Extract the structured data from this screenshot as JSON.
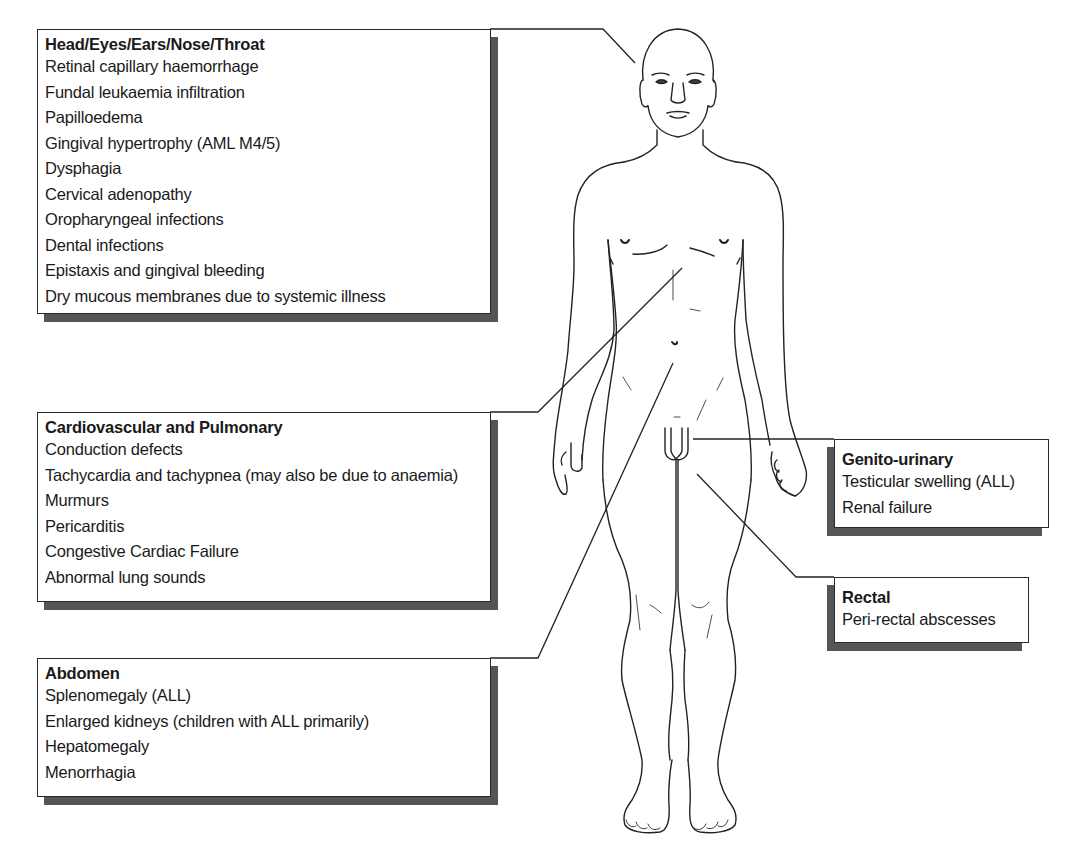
{
  "figure": {
    "line_color": "#222222",
    "shadow_color": "#555555"
  },
  "panels": {
    "heent": {
      "title": "Head/Eyes/Ears/Nose/Throat",
      "items": [
        "Retinal capillary haemorrhage",
        "Fundal leukaemia infiltration",
        "Papilloedema",
        "Gingival hypertrophy (AML M4/5)",
        "Dysphagia",
        "Cervical adenopathy",
        "Oropharyngeal infections",
        "Dental infections",
        "Epistaxis and gingival bleeding",
        "Dry mucous membranes due to systemic illness"
      ],
      "points_to": "head"
    },
    "cardio": {
      "title": "Cardiovascular and Pulmonary",
      "items": [
        "Conduction defects",
        "Tachycardia and tachypnea (may also be due to anaemia)",
        "Murmurs",
        "Pericarditis",
        "Congestive Cardiac Failure",
        "Abnormal lung sounds"
      ],
      "points_to": "chest"
    },
    "abdomen": {
      "title": "Abdomen",
      "items": [
        "Splenomegaly (ALL)",
        "Enlarged kidneys (children with ALL primarily)",
        "Hepatomegaly",
        "Menorrhagia"
      ],
      "points_to": "abdomen"
    },
    "genito": {
      "title": "Genito-urinary",
      "items": [
        "Testicular swelling (ALL)",
        "Renal failure"
      ],
      "points_to": "genitals"
    },
    "rectal": {
      "title": "Rectal",
      "items": [
        "Peri-rectal abscesses"
      ],
      "points_to": "perineum"
    }
  }
}
